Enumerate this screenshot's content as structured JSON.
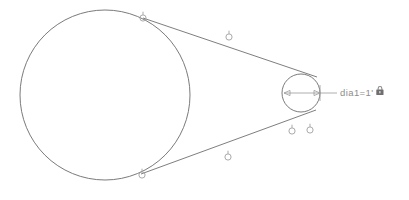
{
  "canvas": {
    "width": 409,
    "height": 200,
    "background_color": "#ffffff",
    "description": "CAD geometric constraint sketch with two tangent circles"
  },
  "colors": {
    "geometry_line": "#6f6f6f",
    "circle_stroke": "#6b6b6b",
    "dimension_line": "#9a9a9a",
    "dimension_text": "#8d8d8d",
    "grip_marker": "#a0a0a0",
    "lock_icon": "#7a7a7a"
  },
  "geometry": {
    "large_circle": {
      "label": "large-circle",
      "cx": 105,
      "cy": 95,
      "r": 85,
      "stroke_width": 0.9
    },
    "small_circle": {
      "label": "small-circle",
      "cx": 301,
      "cy": 93,
      "r": 19,
      "stroke_width": 0.9
    },
    "tangent_lines": [
      {
        "label": "upper-tangent-line",
        "x1": 143,
        "y1": 18,
        "x2": 317,
        "y2": 77
      },
      {
        "label": "lower-tangent-line",
        "x1": 141,
        "y1": 174,
        "x2": 316,
        "y2": 110
      }
    ]
  },
  "dimension": {
    "name": "diameter-dimension",
    "label": "dia1=1'",
    "value": "1'",
    "parameter_name": "dia1",
    "line": {
      "x1": 284,
      "y1": 93,
      "x2": 337,
      "y2": 93
    },
    "arrow_left_x": 287,
    "arrow_right_x": 316,
    "text_x": 340,
    "text_y": 93,
    "extension_tick_x": 320
  },
  "lock_icon": {
    "name": "lock-icon",
    "x": 376,
    "y": 86,
    "width": 8,
    "height": 9,
    "tooltip": "constraint locked"
  },
  "grip_markers": [
    {
      "name": "grip-marker-upper-tangent-point",
      "cx": 143,
      "cy": 18
    },
    {
      "name": "grip-marker-upper-line-midpoint",
      "cx": 229,
      "cy": 37
    },
    {
      "name": "grip-marker-lower-tangent-point",
      "cx": 142,
      "cy": 175
    },
    {
      "name": "grip-marker-lower-line-midpoint",
      "cx": 228,
      "cy": 157
    },
    {
      "name": "grip-marker-small-circle-left",
      "cx": 292,
      "cy": 131
    },
    {
      "name": "grip-marker-small-circle-right",
      "cx": 310,
      "cy": 130
    }
  ],
  "grip_style": {
    "outer_radius": 3.1,
    "inner_radius": 1.5,
    "stem_length": 3.2
  }
}
